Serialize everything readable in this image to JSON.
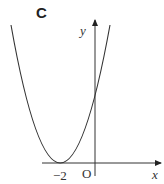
{
  "panel": {
    "label": "C"
  },
  "axes": {
    "x_label": "x",
    "y_label": "y",
    "origin_label": "O",
    "tick_labels": [
      "−2"
    ]
  },
  "curve": {
    "type": "parabola",
    "vertex_x": -2,
    "vertex_on_x_axis": true,
    "opens": "up",
    "description": "Parabola touching the x-axis at x = −2, crossing the y-axis above the origin"
  },
  "colors": {
    "stroke": "#333333",
    "background": "#ffffff"
  }
}
